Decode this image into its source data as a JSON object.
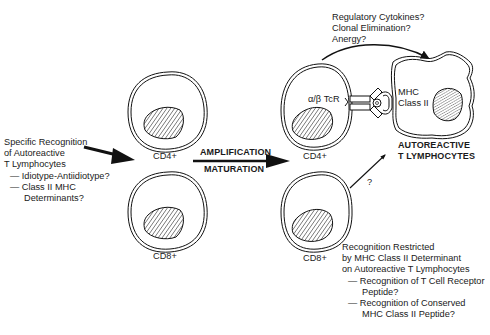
{
  "left_annotation": {
    "lines": [
      "Specific Recognition",
      "of Autoreactive",
      "T Lymphocytes",
      "— Idiotype-Antiidiotype?",
      "— Class II MHC",
      "Determinants?"
    ]
  },
  "initial_cells": {
    "top_label": "CD4+",
    "bottom_label": "CD8+"
  },
  "middle_arrow": {
    "top_label": "AMPLIFICATION",
    "bottom_label": "MATURATION"
  },
  "amplified_cells": {
    "top_label": "CD4+",
    "bottom_label": "CD8+",
    "receptor_label": "α/β TcR",
    "unknown_pathway_label": "?"
  },
  "target_cell": {
    "mhc_label_line1": "MHC",
    "mhc_label_line2": "Class II",
    "title_line1": "AUTOREACTIVE",
    "title_line2": "T LYMPHOCYTES"
  },
  "top_annotation": {
    "lines": [
      "Regulatory Cytokines?",
      "Clonal Elimination?",
      "Anergy?"
    ]
  },
  "bottom_annotation": {
    "lines": [
      "Recognition Restricted",
      "by MHC Class II Determinant",
      "on Autoreactive T Lymphocytes",
      "— Recognition of T Cell Receptor",
      "Peptide?",
      "— Recognition of Conserved",
      "MHC Class II Peptide?"
    ]
  }
}
